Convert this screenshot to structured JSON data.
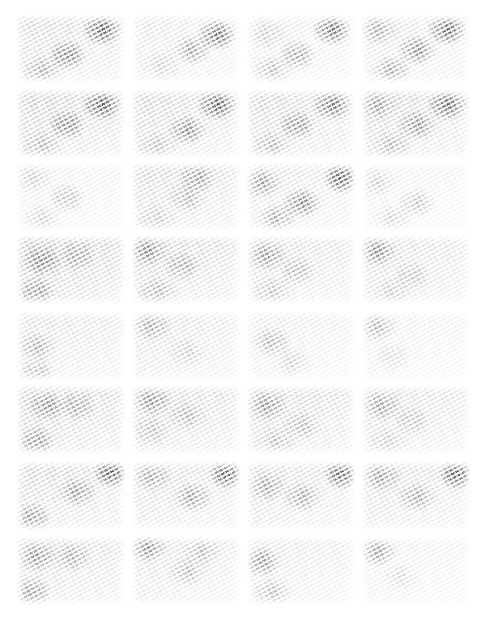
{
  "grid": {
    "columns": 4,
    "rows": 8,
    "col_x": [
      17,
      132,
      247,
      362
    ],
    "row_y": [
      15,
      90,
      163,
      236,
      312,
      386,
      462,
      537
    ],
    "tile_width": 108,
    "tile_height": 68,
    "background": "#ffffff"
  },
  "tiles": [
    {
      "row": 0,
      "col": 0,
      "base": 0.28,
      "blobs": [
        [
          85,
          15,
          0.75
        ],
        [
          50,
          40,
          0.6
        ],
        [
          25,
          55,
          0.35
        ]
      ]
    },
    {
      "row": 0,
      "col": 1,
      "base": 0.18,
      "blobs": [
        [
          85,
          20,
          0.7
        ],
        [
          60,
          35,
          0.45
        ],
        [
          30,
          50,
          0.2
        ]
      ]
    },
    {
      "row": 0,
      "col": 2,
      "base": 0.15,
      "blobs": [
        [
          85,
          15,
          0.7
        ],
        [
          50,
          40,
          0.45
        ],
        [
          25,
          55,
          0.3
        ],
        [
          20,
          20,
          0.2
        ]
      ]
    },
    {
      "row": 0,
      "col": 3,
      "base": 0.2,
      "blobs": [
        [
          85,
          15,
          0.7
        ],
        [
          55,
          35,
          0.55
        ],
        [
          30,
          55,
          0.4
        ],
        [
          15,
          15,
          0.35
        ]
      ]
    },
    {
      "row": 1,
      "col": 0,
      "base": 0.35,
      "blobs": [
        [
          85,
          15,
          0.75
        ],
        [
          50,
          35,
          0.55
        ],
        [
          25,
          55,
          0.3
        ]
      ]
    },
    {
      "row": 1,
      "col": 1,
      "base": 0.3,
      "blobs": [
        [
          85,
          15,
          0.75
        ],
        [
          55,
          40,
          0.55
        ],
        [
          25,
          55,
          0.25
        ]
      ]
    },
    {
      "row": 1,
      "col": 2,
      "base": 0.3,
      "blobs": [
        [
          85,
          15,
          0.65
        ],
        [
          50,
          35,
          0.5
        ],
        [
          25,
          55,
          0.3
        ]
      ]
    },
    {
      "row": 1,
      "col": 3,
      "base": 0.32,
      "blobs": [
        [
          85,
          15,
          0.7
        ],
        [
          55,
          35,
          0.5
        ],
        [
          30,
          55,
          0.3
        ],
        [
          15,
          15,
          0.35
        ]
      ]
    },
    {
      "row": 2,
      "col": 0,
      "base": 0.12,
      "blobs": [
        [
          50,
          35,
          0.3
        ],
        [
          25,
          55,
          0.2
        ],
        [
          15,
          15,
          0.2
        ]
      ]
    },
    {
      "row": 2,
      "col": 1,
      "base": 0.28,
      "blobs": [
        [
          65,
          15,
          0.45
        ],
        [
          55,
          35,
          0.3
        ],
        [
          25,
          55,
          0.2
        ]
      ]
    },
    {
      "row": 2,
      "col": 2,
      "base": 0.2,
      "blobs": [
        [
          95,
          15,
          0.8
        ],
        [
          55,
          40,
          0.6
        ],
        [
          30,
          55,
          0.4
        ],
        [
          15,
          20,
          0.45
        ]
      ]
    },
    {
      "row": 2,
      "col": 3,
      "base": 0.1,
      "blobs": [
        [
          55,
          40,
          0.3
        ],
        [
          30,
          55,
          0.2
        ],
        [
          15,
          20,
          0.2
        ]
      ]
    },
    {
      "row": 3,
      "col": 0,
      "base": 0.4,
      "blobs": [
        [
          25,
          25,
          0.55
        ],
        [
          20,
          55,
          0.45
        ],
        [
          60,
          20,
          0.35
        ]
      ]
    },
    {
      "row": 3,
      "col": 1,
      "base": 0.32,
      "blobs": [
        [
          15,
          15,
          0.5
        ],
        [
          50,
          30,
          0.35
        ],
        [
          25,
          55,
          0.3
        ]
      ]
    },
    {
      "row": 3,
      "col": 2,
      "base": 0.25,
      "blobs": [
        [
          20,
          20,
          0.45
        ],
        [
          50,
          35,
          0.3
        ],
        [
          25,
          55,
          0.25
        ]
      ]
    },
    {
      "row": 3,
      "col": 3,
      "base": 0.25,
      "blobs": [
        [
          15,
          15,
          0.5
        ],
        [
          50,
          40,
          0.25
        ],
        [
          30,
          55,
          0.2
        ]
      ]
    },
    {
      "row": 4,
      "col": 0,
      "base": 0.22,
      "blobs": [
        [
          20,
          35,
          0.35
        ],
        [
          20,
          60,
          0.3
        ]
      ]
    },
    {
      "row": 4,
      "col": 1,
      "base": 0.22,
      "blobs": [
        [
          20,
          15,
          0.35
        ],
        [
          55,
          40,
          0.2
        ]
      ]
    },
    {
      "row": 4,
      "col": 2,
      "base": 0.15,
      "blobs": [
        [
          25,
          30,
          0.35
        ],
        [
          45,
          50,
          0.2
        ]
      ]
    },
    {
      "row": 4,
      "col": 3,
      "base": 0.12,
      "blobs": [
        [
          15,
          15,
          0.35
        ],
        [
          30,
          45,
          0.15
        ]
      ]
    },
    {
      "row": 5,
      "col": 0,
      "base": 0.35,
      "blobs": [
        [
          30,
          20,
          0.45
        ],
        [
          20,
          55,
          0.45
        ],
        [
          60,
          20,
          0.35
        ]
      ]
    },
    {
      "row": 5,
      "col": 1,
      "base": 0.3,
      "blobs": [
        [
          20,
          15,
          0.45
        ],
        [
          55,
          30,
          0.3
        ],
        [
          20,
          45,
          0.25
        ]
      ]
    },
    {
      "row": 5,
      "col": 2,
      "base": 0.3,
      "blobs": [
        [
          20,
          20,
          0.45
        ],
        [
          55,
          40,
          0.3
        ],
        [
          30,
          55,
          0.25
        ]
      ]
    },
    {
      "row": 5,
      "col": 3,
      "base": 0.25,
      "blobs": [
        [
          20,
          20,
          0.4
        ],
        [
          50,
          35,
          0.25
        ],
        [
          25,
          55,
          0.2
        ]
      ]
    },
    {
      "row": 6,
      "col": 0,
      "base": 0.3,
      "blobs": [
        [
          95,
          10,
          0.8
        ],
        [
          60,
          30,
          0.45
        ],
        [
          15,
          55,
          0.45
        ]
      ]
    },
    {
      "row": 6,
      "col": 1,
      "base": 0.25,
      "blobs": [
        [
          95,
          12,
          0.75
        ],
        [
          60,
          35,
          0.45
        ],
        [
          20,
          15,
          0.35
        ]
      ]
    },
    {
      "row": 6,
      "col": 2,
      "base": 0.25,
      "blobs": [
        [
          95,
          12,
          0.75
        ],
        [
          55,
          35,
          0.4
        ],
        [
          20,
          25,
          0.4
        ]
      ]
    },
    {
      "row": 6,
      "col": 3,
      "base": 0.25,
      "blobs": [
        [
          95,
          12,
          0.8
        ],
        [
          55,
          35,
          0.4
        ],
        [
          20,
          15,
          0.4
        ]
      ]
    },
    {
      "row": 7,
      "col": 0,
      "base": 0.28,
      "blobs": [
        [
          20,
          20,
          0.45
        ],
        [
          15,
          55,
          0.45
        ],
        [
          55,
          20,
          0.35
        ]
      ]
    },
    {
      "row": 7,
      "col": 1,
      "base": 0.22,
      "blobs": [
        [
          15,
          10,
          0.5
        ],
        [
          55,
          35,
          0.3
        ],
        [
          70,
          15,
          0.3
        ]
      ]
    },
    {
      "row": 7,
      "col": 2,
      "base": 0.18,
      "blobs": [
        [
          15,
          25,
          0.5
        ],
        [
          25,
          55,
          0.3
        ]
      ]
    },
    {
      "row": 7,
      "col": 3,
      "base": 0.12,
      "blobs": [
        [
          15,
          15,
          0.45
        ],
        [
          40,
          40,
          0.15
        ]
      ]
    }
  ]
}
